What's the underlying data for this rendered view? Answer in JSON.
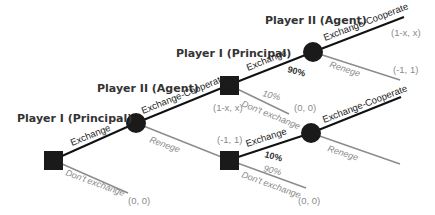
{
  "colors": {
    "node": "#1a1a1a",
    "edge_dark": "#111111",
    "edge_light": "#8c8c8c",
    "label_dark": "#222222",
    "label_light": "#8a8a8a",
    "background": "#ffffff"
  },
  "players": {
    "p1_root": "Player I (Principal)",
    "p2_first": "Player II (Agent)",
    "p1_second": "Player I (Principal)",
    "p2_top": "Player II (Agent)"
  },
  "moves": {
    "root_exchange": "Exchange",
    "root_dont": "Don't exchange",
    "c1_cooperate": "Exchange-Cooperate",
    "c1_renege": "Renege",
    "s2_exchange": "Exchange",
    "s2_dont": "Don't exchange",
    "c2_cooperate": "Exchange-Cooperate",
    "c2_renege": "Renege",
    "s3_exchange": "Exchange",
    "s3_dont": "Don't exchange",
    "c3_cooperate": "Exchange-Cooperate",
    "c3_renege": "Renege"
  },
  "probabilities": {
    "s2_exchange": "90%",
    "s2_dont": "10%",
    "s3_exchange": "10%",
    "s3_dont": "90%"
  },
  "payoffs": {
    "root_dont": "(0, 0)",
    "s2_node": "(1-x, x)",
    "s2_dont": "(0, 0)",
    "s3_node": "(-1, 1)",
    "s3_dont": "(0, 0)",
    "c2_cooperate": "(1-x, x)",
    "c2_renege": "(-1, 1)"
  },
  "nodes": [
    {
      "id": "root",
      "type": "square",
      "player": "Player I (Principal)"
    },
    {
      "id": "c1",
      "type": "circle",
      "player": "Player II (Agent)"
    },
    {
      "id": "s2",
      "type": "square",
      "player": "Player I (Principal)"
    },
    {
      "id": "s3",
      "type": "square",
      "player": "Player I (Principal)"
    },
    {
      "id": "c2",
      "type": "circle",
      "player": "Player II (Agent)"
    },
    {
      "id": "c3",
      "type": "circle",
      "player": "Player II (Agent)"
    }
  ]
}
